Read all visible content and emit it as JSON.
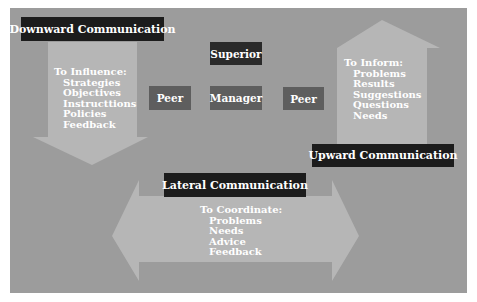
{
  "diagram": {
    "colors": {
      "panel": "#9c9c9c",
      "arrow": "#b6b6b6",
      "label_box": "#1c1c1c",
      "superior_box": "#2a2a2a",
      "peer_box": "#5e5e5e",
      "text": "#ffffff"
    },
    "nodes": {
      "superior": "Superior",
      "manager": "Manager",
      "peer_left": "Peer",
      "peer_right": "Peer"
    },
    "downward": {
      "title": "Downward Communication",
      "heading": "To Influence:",
      "items": [
        "Strategies",
        "Objectives",
        "Instructtions",
        "Policies",
        "Feedback"
      ]
    },
    "upward": {
      "title": "Upward Communication",
      "heading": "To Inform:",
      "items": [
        "Problems",
        "Results",
        "Suggestions",
        "Questions",
        "Needs"
      ]
    },
    "lateral": {
      "title": "Lateral Communication",
      "heading": "To Coordinate:",
      "items": [
        "Problems",
        "Needs",
        "Advice",
        "Feedback"
      ]
    }
  }
}
